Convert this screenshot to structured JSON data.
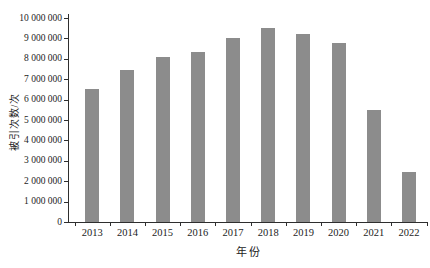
{
  "chart_data": {
    "type": "bar",
    "title": "",
    "xlabel": "年份",
    "ylabel": "被引次数/次",
    "categories": [
      "2013",
      "2014",
      "2015",
      "2016",
      "2017",
      "2018",
      "2019",
      "2020",
      "2021",
      "2022"
    ],
    "values": [
      6500000,
      7450000,
      8100000,
      8350000,
      9000000,
      9500000,
      9200000,
      8750000,
      5500000,
      2450000
    ],
    "ylim": [
      0,
      10000000
    ],
    "ytick_interval": 1000000,
    "ytick_labels": [
      "0",
      "1 000 000",
      "2 000 000",
      "3 000 000",
      "4 000 000",
      "5 000 000",
      "6 000 000",
      "7 000 000",
      "8 000 000",
      "9 000 000",
      "10 000 000"
    ],
    "grid": false,
    "legend": null,
    "colors": {
      "bar": "#8c8c8c",
      "axis": "#2e2e2e",
      "text": "#1c1c1c",
      "background": "#ffffff"
    }
  }
}
